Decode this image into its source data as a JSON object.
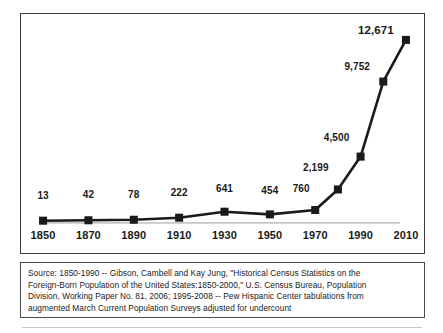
{
  "chart_data": {
    "type": "line",
    "title": "",
    "subtitle": "",
    "xlabel": "",
    "ylabel": "",
    "grid": false,
    "legend": "none",
    "x": [
      1850,
      1870,
      1890,
      1910,
      1930,
      1950,
      1970,
      1980,
      1990,
      2000,
      2010
    ],
    "values": [
      13,
      42,
      78,
      222,
      641,
      454,
      760,
      2199,
      4500,
      9752,
      12671
    ],
    "point_labels": [
      "13",
      "42",
      "78",
      "222",
      "641",
      "454",
      "760",
      "2,199",
      "4,500",
      "9,752",
      "12,671"
    ],
    "xlim": [
      1850,
      2010
    ],
    "ylim": [
      0,
      13500
    ],
    "x_tick_labels": [
      "1850",
      "1870",
      "1890",
      "1910",
      "1930",
      "1950",
      "1970",
      "1990",
      "2010"
    ],
    "x_ticks": [
      1850,
      1870,
      1890,
      1910,
      1930,
      1950,
      1970,
      1990,
      2010
    ],
    "series_name": "Foreign-Born Population (thousands)",
    "marker": "square",
    "line_color": "#1a1a1a",
    "marker_color": "#1a1a1a",
    "baseline_color": "#c0c0c0",
    "emphasized_label": "12,671"
  },
  "source": {
    "line1": "Source: 1850-1990 -- Gibson, Cambell and Kay Jung, \"Historical Census Statistics on the",
    "line2": "Foreign-Born Population of the United States:1850-2000,\" U.S. Census   Bureau, Population",
    "line3": "Division, Working Paper No. 81, 2006; 1995-2008 -- Pew Hispanic Center tabulations from",
    "line4": "augmented March Current Population Surveys adjusted for undercount",
    "full": "Source: 1850-1990 -- Gibson, Cambell and Kay Jung, \"Historical Census Statistics on the Foreign-Born Population of the United States:1850-2000,\" U.S. Census   Bureau, Population Division, Working Paper No. 81, 2006; 1995-2008 -- Pew Hispanic Center tabulations from augmented March Current Population Surveys adjusted for undercount"
  }
}
